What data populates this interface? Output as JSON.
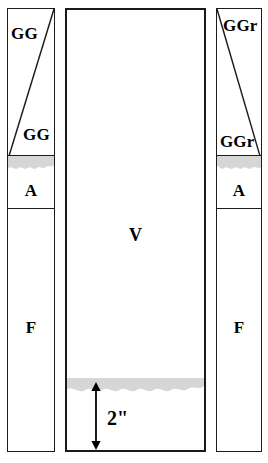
{
  "diagram": {
    "type": "soil-profile-column-diagram",
    "background_color": "#ffffff",
    "line_color": "#1a1a1a",
    "band_color": "#d6d6d6",
    "columns": [
      {
        "id": "left",
        "name": "left-column",
        "x": 7,
        "y": 8,
        "width": 48,
        "height": 444,
        "diagonal": "bottom-left-to-top-right",
        "segments": [
          {
            "name": "gg-block",
            "label_top": "GG",
            "label_bottom": "GG",
            "y": 0,
            "height": 148
          },
          {
            "name": "a-horizon",
            "label": "A",
            "y": 150,
            "height": 50
          },
          {
            "name": "f-horizon",
            "label": "F",
            "y": 200,
            "height": 244
          }
        ]
      },
      {
        "id": "center",
        "name": "center-column",
        "x": 65,
        "y": 8,
        "width": 141,
        "height": 444,
        "label": "V",
        "dimension": "2\""
      },
      {
        "id": "right",
        "name": "right-column",
        "x": 216,
        "y": 8,
        "width": 46,
        "height": 444,
        "diagonal": "top-left-to-bottom-right",
        "segments": [
          {
            "name": "ggr-block",
            "label_top": "GGr",
            "label_bottom": "GGr",
            "y": 0,
            "height": 148
          },
          {
            "name": "a-horizon",
            "label": "A",
            "y": 150,
            "height": 50
          },
          {
            "name": "f-horizon",
            "label": "F",
            "y": 200,
            "height": 244
          }
        ]
      }
    ]
  },
  "labels": {
    "left": {
      "gg_top": "GG",
      "gg_bottom": "GG",
      "a": "A",
      "f": "F"
    },
    "center": {
      "v": "V",
      "dimension": "2\""
    },
    "right": {
      "ggr_top": "GGr",
      "ggr_bottom": "GGr",
      "a": "A",
      "f": "F"
    }
  }
}
